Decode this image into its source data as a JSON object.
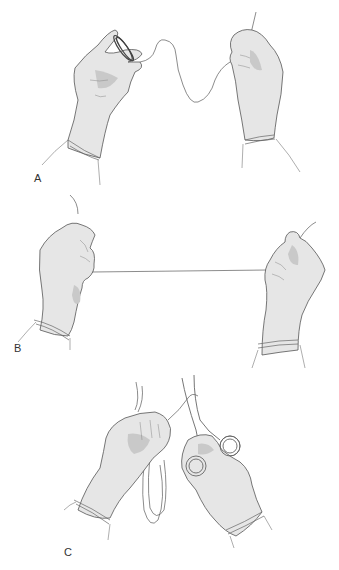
{
  "figure": {
    "panels": [
      {
        "id": "A",
        "label": "A",
        "description": "Left gloved hand holding coiled suture; right gloved hand holding free end; wavy slack suture between"
      },
      {
        "id": "B",
        "label": "B",
        "description": "Both gloved hands pulling suture taut in a straight horizontal line"
      },
      {
        "id": "C",
        "label": "C",
        "description": "Left gloved hand holding suture loops; right gloved hand holding scissors cutting suture"
      }
    ]
  },
  "colors": {
    "background": "#ffffff",
    "glove_fill": "#e6e6e6",
    "glove_shadow": "#c9c9c9",
    "outline": "#555555",
    "label": "#333333"
  }
}
